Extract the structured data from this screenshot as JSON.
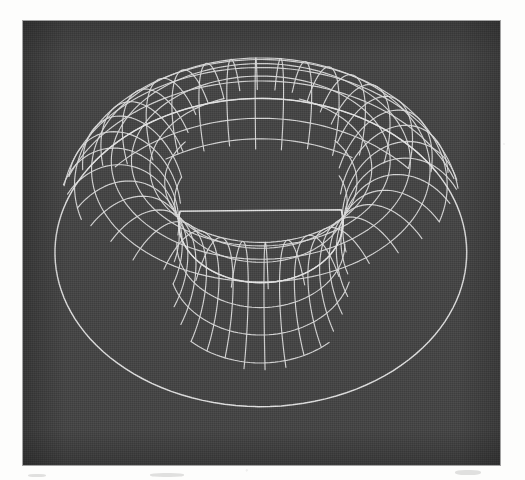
{
  "figure": {
    "kind": "3d-wireframe-render",
    "object_name": "torus",
    "caption": "",
    "background_color": "#434343",
    "line_color": "#dedede",
    "page_color": "#fdfdfc",
    "panel": {
      "x": 23,
      "y": 21,
      "width": 477,
      "height": 444
    }
  },
  "chart_data": {
    "type": "scatter",
    "title": "",
    "subtitle": "",
    "xlabel": "",
    "ylabel": "",
    "surface": "torus",
    "projection": "perspective",
    "shading": "wireframe",
    "grid": true,
    "legend": null,
    "annotations": [],
    "geometry": {
      "major_radius_R": 1.0,
      "minor_radius_r": 0.42,
      "u_segments": 36,
      "v_segments": 20,
      "u_label": "toroidal angle",
      "v_label": "poloidal angle"
    },
    "camera": {
      "azimuth_deg": -18,
      "elevation_deg": 32,
      "roll_deg": 0,
      "distance": 5.2,
      "focal_length": 3.1
    },
    "screen_extents": {
      "outer_left_px": 55,
      "outer_right_px": 466,
      "outer_top_px": 58,
      "outer_bottom_px": 438,
      "hole_left_px": 210,
      "hole_right_px": 347,
      "hole_top_px": 196,
      "hole_bottom_px": 256
    },
    "xlim": [
      -1.45,
      1.45
    ],
    "ylim": [
      -1.45,
      1.45
    ]
  }
}
